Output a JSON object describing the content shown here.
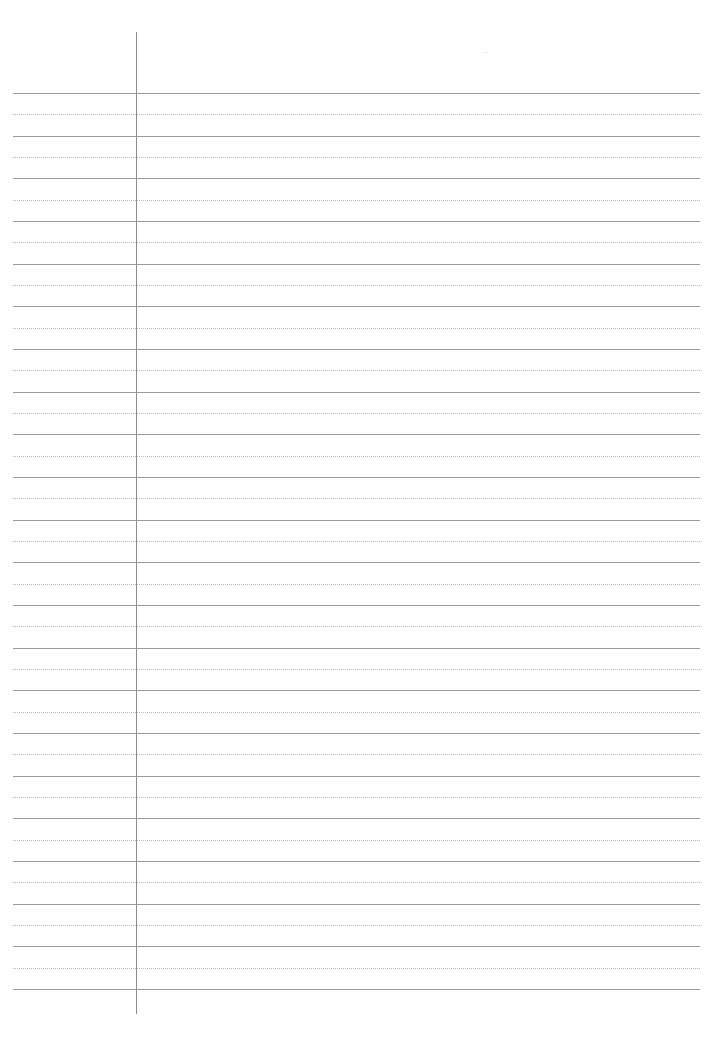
{
  "page": {
    "type": "ruled-notebook-page",
    "background": "#ffffff",
    "margin_line": {
      "x": 136,
      "top": 32,
      "bottom": 1014,
      "color": "#8a8a8a"
    },
    "rules": {
      "first_solid_y": 93,
      "spacing": 42.67,
      "solid_count": 22,
      "left": 13,
      "right": 700,
      "solid_color": "#9a9a9a",
      "dotted_color": "#b8b8b8"
    },
    "text_content": []
  }
}
